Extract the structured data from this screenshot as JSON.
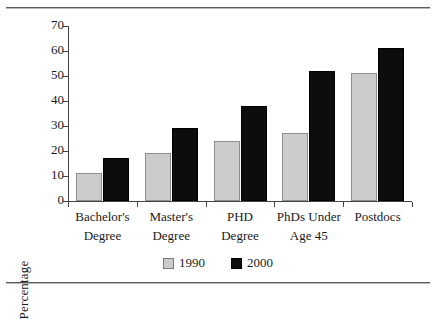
{
  "chart_data": {
    "type": "bar",
    "title": "",
    "xlabel": "",
    "ylabel": "Percentage",
    "ylim": [
      0,
      70
    ],
    "yticks": [
      0,
      10,
      20,
      30,
      40,
      50,
      60,
      70
    ],
    "grid": false,
    "legend_position": "bottom-center",
    "categories": [
      "Bachelor's Degree",
      "Master's Degree",
      "PHD Degree",
      "PhDs Under Age 45",
      "Postdocs"
    ],
    "category_lines": [
      [
        "Bachelor's",
        "Degree"
      ],
      [
        "Master's",
        "Degree"
      ],
      [
        "PHD",
        "Degree"
      ],
      [
        "PhDs Under",
        "Age 45"
      ],
      [
        "Postdocs",
        ""
      ]
    ],
    "series": [
      {
        "name": "1990",
        "color": "#cccccc",
        "values": [
          11,
          19,
          24,
          27,
          51
        ]
      },
      {
        "name": "2000",
        "color": "#0d0d0d",
        "values": [
          17,
          29,
          38,
          52,
          61
        ]
      }
    ]
  },
  "legend": {
    "items": [
      {
        "label": "1990",
        "swatch": "light-gray-square"
      },
      {
        "label": "2000",
        "swatch": "black-square"
      }
    ]
  }
}
